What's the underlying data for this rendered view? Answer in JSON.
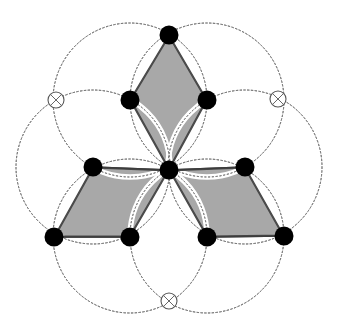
{
  "figure": {
    "title": "Three-rhombus rosette with six dotted construction circles",
    "type": "geometric-construction",
    "canvas": {
      "width": 338,
      "height": 332,
      "background": "#ffffff"
    }
  },
  "style": {
    "rhombus_fill": "#a8a8a8",
    "rhombus_stroke": "#4a4a4a",
    "rhombus_stroke_width": 1.4,
    "circle_stroke": "#777777",
    "circle_stroke_width": 0.9,
    "circle_dash": "1.6 2.2",
    "node_fill": "#000000",
    "node_stroke": "none",
    "node_radius": 9.5,
    "center_node_radius": 9.5,
    "hollow_fill": "#ffffff",
    "hollow_stroke": "#555555",
    "hollow_stroke_width": 1.1,
    "hollow_radius": 8,
    "arc_stroke": "#6a6a6a",
    "arc_stroke_width": 0.9,
    "edge_stroke": "#3c3c3c",
    "edge_stroke_width": 1.5
  },
  "geometry": {
    "center": {
      "x": 169,
      "y": 170
    },
    "circle_radius": 77,
    "circle_centers": [
      {
        "id": "circle-top-left",
        "x": 130,
        "y": 100
      },
      {
        "id": "circle-top-right",
        "x": 207,
        "y": 100
      },
      {
        "id": "circle-right",
        "x": 245,
        "y": 167
      },
      {
        "id": "circle-bottom-right",
        "x": 207,
        "y": 236
      },
      {
        "id": "circle-bottom-left",
        "x": 130,
        "y": 236
      },
      {
        "id": "circle-left",
        "x": 93,
        "y": 167
      }
    ]
  },
  "nodes": {
    "filled": [
      {
        "id": "node-top",
        "label": "A",
        "x": 169,
        "y": 35
      },
      {
        "id": "node-upper-left",
        "label": "B",
        "x": 130,
        "y": 100
      },
      {
        "id": "node-upper-right",
        "label": "C",
        "x": 207,
        "y": 100
      },
      {
        "id": "node-mid-left",
        "label": "D",
        "x": 93,
        "y": 167
      },
      {
        "id": "node-center",
        "label": "O",
        "x": 169,
        "y": 170
      },
      {
        "id": "node-mid-right",
        "label": "E",
        "x": 245,
        "y": 167
      },
      {
        "id": "node-lower-left",
        "label": "F",
        "x": 54,
        "y": 237
      },
      {
        "id": "node-lower-midleft",
        "label": "G",
        "x": 130,
        "y": 237
      },
      {
        "id": "node-lower-midright",
        "label": "H",
        "x": 207,
        "y": 237
      },
      {
        "id": "node-lower-right",
        "label": "I",
        "x": 284,
        "y": 236
      }
    ],
    "hollow": [
      {
        "id": "hollow-left",
        "label": "x",
        "x": 56,
        "y": 100
      },
      {
        "id": "hollow-right",
        "label": "x",
        "x": 278,
        "y": 99
      },
      {
        "id": "hollow-bottom",
        "label": "x",
        "x": 169,
        "y": 301
      }
    ]
  },
  "rhombi": [
    {
      "id": "rhombus-top",
      "vertices": [
        {
          "x": 169,
          "y": 35
        },
        {
          "x": 207,
          "y": 100
        },
        {
          "x": 169,
          "y": 170
        },
        {
          "x": 130,
          "y": 100
        }
      ]
    },
    {
      "id": "rhombus-lower-left",
      "vertices": [
        {
          "x": 93,
          "y": 167
        },
        {
          "x": 169,
          "y": 170
        },
        {
          "x": 130,
          "y": 237
        },
        {
          "x": 54,
          "y": 237
        }
      ]
    },
    {
      "id": "rhombus-lower-right",
      "vertices": [
        {
          "x": 245,
          "y": 167
        },
        {
          "x": 284,
          "y": 236
        },
        {
          "x": 207,
          "y": 237
        },
        {
          "x": 169,
          "y": 170
        }
      ]
    }
  ],
  "straight_edges": [
    {
      "id": "edge-f-g",
      "x1": 54,
      "y1": 237,
      "x2": 130,
      "y2": 237
    },
    {
      "id": "edge-h-i",
      "x1": 207,
      "y1": 237,
      "x2": 284,
      "y2": 236
    },
    {
      "id": "edge-d-o",
      "x1": 93,
      "y1": 167,
      "x2": 169,
      "y2": 170
    },
    {
      "id": "edge-o-e",
      "x1": 169,
      "y1": 170,
      "x2": 245,
      "y2": 167
    }
  ],
  "center_arcs": {
    "description": "Six circle arcs converging into the central node creating white lens gaps",
    "count": 6
  }
}
